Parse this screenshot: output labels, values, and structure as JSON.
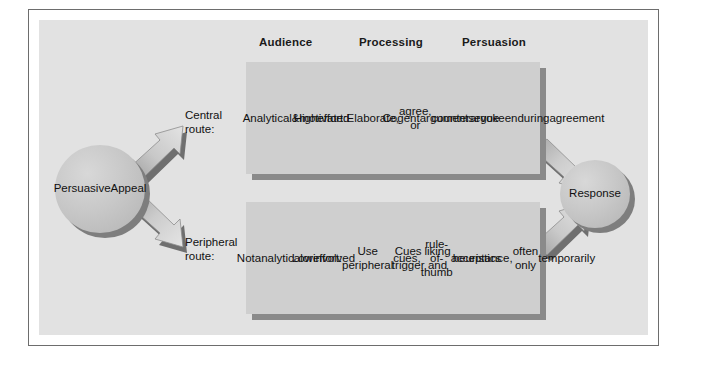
{
  "figure": {
    "background_color": "#e2e2e2",
    "frame_color": "#6d6d6d",
    "box_color": "#cfcfcf",
    "shadow_color": "#8a8a8a",
    "circle_color": "#c8c8c8"
  },
  "headers": [
    {
      "label": "Audience"
    },
    {
      "label": "Processing"
    },
    {
      "label": "Persuasion"
    }
  ],
  "source": {
    "label": "Persuasive\nAppeal",
    "line1": "Persuasive",
    "line2": "Appeal"
  },
  "outcome": {
    "label": "Response"
  },
  "routes": [
    {
      "id": "central",
      "label_line1": "Central",
      "label_line2": "route:",
      "cells": [
        {
          "column": "Audience",
          "text": "Analytical\n&\nmotivated"
        },
        {
          "column": "Processing",
          "text": "High\neffort:\nElaborate,\nagree, or\ncounterargue"
        },
        {
          "column": "Persuasion",
          "text": "Cogent\narguments\nevoke\nenduring\nagreement"
        }
      ]
    },
    {
      "id": "peripheral",
      "label_line1": "Peripheral",
      "label_line2": "route:",
      "cells": [
        {
          "column": "Audience",
          "text": "Not\nanalytical\nor\ninvolved"
        },
        {
          "column": "Processing",
          "text": "Low\neffort:\nUse peripheral\ncues,\nrule-of-thumb\nheuristics"
        },
        {
          "column": "Persuasion",
          "text": "Cues trigger\nliking and\nacceptance,\noften only\ntemporarily"
        }
      ]
    }
  ],
  "arrows": [
    {
      "name": "appeal-to-central-route",
      "direction": "up-right"
    },
    {
      "name": "appeal-to-peripheral-route",
      "direction": "down-right"
    },
    {
      "name": "central-route-to-response",
      "direction": "down-right"
    },
    {
      "name": "peripheral-route-to-response",
      "direction": "up-right"
    }
  ]
}
